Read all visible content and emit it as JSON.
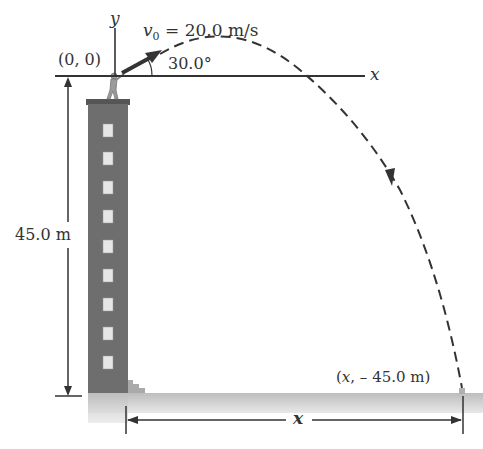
{
  "diagram": {
    "type": "projectile-motion",
    "labels": {
      "y_axis": "y",
      "x_axis": "x",
      "origin": "(0, 0)",
      "v0_symbol": "v",
      "v0_sub": "0",
      "v0_value": " = 20.0 m/s",
      "angle": "30.0°",
      "height": "45.0 m",
      "landing_x": "x",
      "landing_rest": ", – 45.0 m)",
      "landing_open": "(",
      "range": "x"
    },
    "physics": {
      "initial_speed_m_s": 20.0,
      "launch_angle_deg": 30.0,
      "building_height_m": 45.0,
      "origin": [
        0,
        0
      ],
      "landing_point": [
        "x",
        -45.0
      ]
    },
    "colors": {
      "building": "#6e6e6e",
      "ground": "#c9c9c9",
      "lines": "#333333",
      "window": "#e6e6e6"
    }
  }
}
